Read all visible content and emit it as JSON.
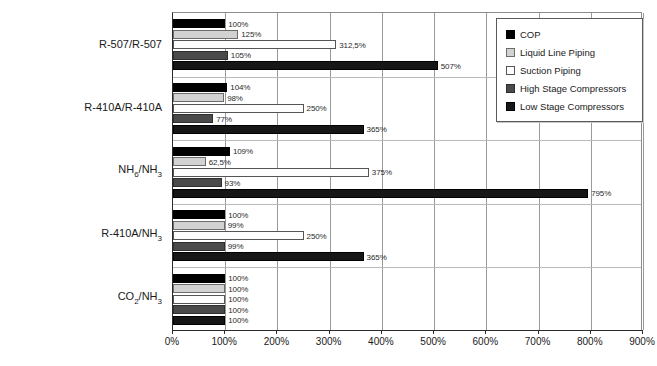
{
  "chart_data": {
    "type": "bar",
    "orientation": "horizontal",
    "title": "",
    "xlabel": "",
    "ylabel": "",
    "xlim": [
      0,
      900
    ],
    "xticks": [
      "0%",
      "100%",
      "200%",
      "300%",
      "400%",
      "500%",
      "600%",
      "700%",
      "800%",
      "900%"
    ],
    "xtick_values": [
      0,
      100,
      200,
      300,
      400,
      500,
      600,
      700,
      800,
      900
    ],
    "grid": true,
    "grid_axis": "x",
    "legend_position": "top-right",
    "categories": [
      "R-507/R-507",
      "R-410A/R-410A",
      "NH6/NH3",
      "R-410A/NH3",
      "CO2/NH3"
    ],
    "category_labels_html": [
      "R-507/R-507",
      "R-410A/R-410A",
      "NH<sub>6</sub>/NH<sub>3</sub>",
      "R-410A/NH<sub>3</sub>",
      "CO<sub>2</sub>/NH<sub>3</sub>"
    ],
    "series": [
      {
        "name": "COP",
        "color": "#000000",
        "values": [
          100,
          104,
          109,
          100,
          100
        ],
        "labels": [
          "100%",
          "104%",
          "109%",
          "100%",
          "100%"
        ]
      },
      {
        "name": "Liquid Line Piping",
        "color": "#d2d2d2",
        "values": [
          125,
          98,
          62.5,
          99,
          100
        ],
        "labels": [
          "125%",
          "98%",
          "62,5%",
          "99%",
          "100%"
        ]
      },
      {
        "name": "Suction Piping",
        "color": "#fdfdfd",
        "values": [
          312.5,
          250,
          375,
          250,
          100
        ],
        "labels": [
          "312,5%",
          "250%",
          "375%",
          "250%",
          "100%"
        ]
      },
      {
        "name": "High Stage Compressors",
        "color": "#4a4a4a",
        "values": [
          105,
          77,
          93,
          99,
          100
        ],
        "labels": [
          "105%",
          "77%",
          "93%",
          "99%",
          "100%"
        ]
      },
      {
        "name": "Low Stage Compressors",
        "color": "#161616",
        "values": [
          507,
          365,
          795,
          365,
          100
        ],
        "labels": [
          "507%",
          "365%",
          "795%",
          "365%",
          "100%"
        ]
      }
    ],
    "legend": [
      "COP",
      "Liquid Line Piping",
      "Suction Piping",
      "High Stage Compressors",
      "Low Stage Compressors"
    ]
  }
}
